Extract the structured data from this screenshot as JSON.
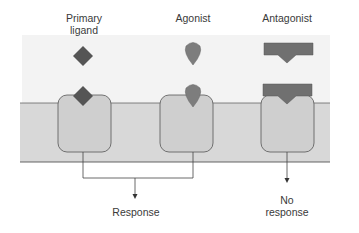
{
  "labels": {
    "primary_ligand_line1": "Primary",
    "primary_ligand_line2": "ligand",
    "agonist": "Agonist",
    "antagonist": "Antagonist",
    "response": "Response",
    "no_response_line1": "No",
    "no_response_line2": "response"
  },
  "colors": {
    "extracellular": "#f3f3f3",
    "membrane": "#d8d8d8",
    "receptor": "#cfcfcf",
    "primary_ligand": "#555555",
    "agonist": "#7d7d7d",
    "antagonist": "#707070",
    "outline": "#555555"
  },
  "diagram": {
    "columns": [
      {
        "name": "primary-ligand",
        "receptor_bound": true,
        "outcome": "response"
      },
      {
        "name": "agonist",
        "receptor_bound": true,
        "outcome": "response"
      },
      {
        "name": "antagonist",
        "receptor_bound": true,
        "outcome": "no response"
      }
    ]
  }
}
